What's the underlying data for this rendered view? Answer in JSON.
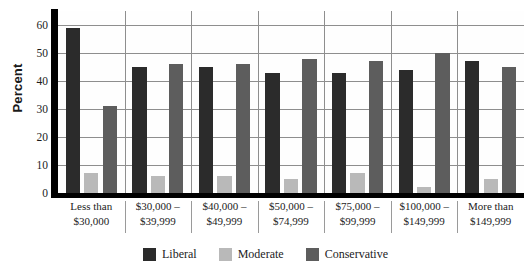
{
  "chart_data": {
    "type": "bar",
    "title": "",
    "subtitle": "",
    "xlabel": "",
    "ylabel": "Percent",
    "ylim": [
      0,
      65
    ],
    "yticks": [
      0,
      10,
      20,
      30,
      40,
      50,
      60
    ],
    "ytick_labels": [
      "0",
      "10",
      "20",
      "30",
      "40",
      "50",
      "60"
    ],
    "grid": true,
    "legend_position": "bottom",
    "categories": [
      "Less than $30,000",
      "$30,000 – $39,999",
      "$40,000 – $49,999",
      "$50,000 – $74,999",
      "$75,000 – $99,999",
      "$100,000 – $149,999",
      "More than $149,999"
    ],
    "category_lines": [
      [
        "Less than",
        "$30,000"
      ],
      [
        "$30,000 –",
        "$39,999"
      ],
      [
        "$40,000 –",
        "$49,999"
      ],
      [
        "$50,000 –",
        "$74,999"
      ],
      [
        "$75,000 –",
        "$99,999"
      ],
      [
        "$100,000 –",
        "$149,999"
      ],
      [
        "More than",
        "$149,999"
      ]
    ],
    "series": [
      {
        "name": "Liberal",
        "color": "#2b2b2b",
        "values": [
          59,
          45,
          45,
          43,
          43,
          44,
          47
        ]
      },
      {
        "name": "Moderate",
        "color": "#b9b9b9",
        "values": [
          7,
          6,
          6,
          5,
          7,
          2,
          5
        ]
      },
      {
        "name": "Conservative",
        "color": "#5d5d5d",
        "values": [
          31,
          46,
          46,
          48,
          47,
          50,
          45
        ]
      }
    ]
  },
  "legend": {
    "items": [
      {
        "label": "Liberal",
        "color": "#2b2b2b"
      },
      {
        "label": "Moderate",
        "color": "#b9b9b9"
      },
      {
        "label": "Conservative",
        "color": "#5d5d5d"
      }
    ]
  }
}
